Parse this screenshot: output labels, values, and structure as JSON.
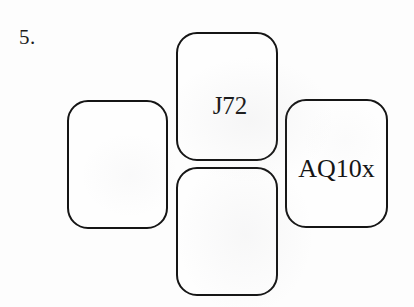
{
  "page": {
    "background_color": "#fdfdfd",
    "ink_color": "#151515",
    "question_number": "5."
  },
  "diagram": {
    "layout": "cross",
    "cards": [
      {
        "position": "left",
        "label": "",
        "filled": false
      },
      {
        "position": "top",
        "label": "J72",
        "filled": true
      },
      {
        "position": "bottom",
        "label": "",
        "filled": false
      },
      {
        "position": "right",
        "label": "AQ10x",
        "filled": true
      }
    ]
  }
}
